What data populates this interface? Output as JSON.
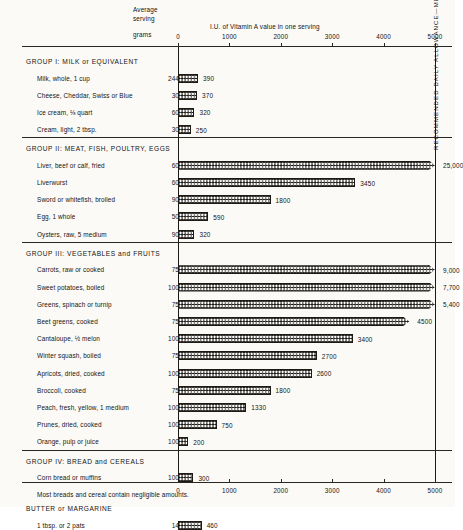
{
  "header": {
    "average_serving_line1": "Average",
    "average_serving_line2": "serving",
    "grams_label": "grams",
    "chart_subtitle": "I.U. of Vitamin A value in one serving"
  },
  "rda_label": "RECOMMENDED DAILY ALLOWANCE—MEN AND WOMEN",
  "axis": {
    "ticks": [
      "0",
      "1000",
      "2000",
      "3000",
      "4000",
      "5000"
    ],
    "tick_values": [
      0,
      1000,
      2000,
      3000,
      4000,
      5000
    ]
  },
  "groups": [
    {
      "title": "GROUP I: MILK or EQUIVALENT",
      "rows": [
        {
          "food": "Milk, whole, 1 cup",
          "grams": "244",
          "value": 390,
          "value_label": "390"
        },
        {
          "food": "Cheese, Cheddar, Swiss or Blue",
          "grams": "30",
          "value": 370,
          "value_label": "370"
        },
        {
          "food": "Ice cream, ⅛ quart",
          "grams": "60",
          "value": 320,
          "value_label": "320"
        },
        {
          "food": "Cream, light, 2 tbsp.",
          "grams": "30",
          "value": 250,
          "value_label": "250"
        }
      ]
    },
    {
      "title": "GROUP II: MEAT, FISH, POULTRY, EGGS",
      "rows": [
        {
          "food": "Liver, beef or calf, fried",
          "grams": "60",
          "value": 25000,
          "value_label": "25,000",
          "clipped": true
        },
        {
          "food": "Liverwurst",
          "grams": "60",
          "value": 3450,
          "value_label": "3450"
        },
        {
          "food": "Sword or whitefish, broiled",
          "grams": "90",
          "value": 1800,
          "value_label": "1800"
        },
        {
          "food": "Egg, 1 whole",
          "grams": "50",
          "value": 590,
          "value_label": "590"
        },
        {
          "food": "Oysters, raw, 5 medium",
          "grams": "90",
          "value": 320,
          "value_label": "320"
        }
      ]
    },
    {
      "title": "GROUP III: VEGETABLES and FRUITS",
      "rows": [
        {
          "food": "Carrots, raw or cooked",
          "grams": "75",
          "value": 9000,
          "value_label": "9,000",
          "clipped": true
        },
        {
          "food": "Sweet potatoes, boiled",
          "grams": "100",
          "value": 7700,
          "value_label": "7,700",
          "clipped": true
        },
        {
          "food": "Greens, spinach or turnip",
          "grams": "75",
          "value": 5400,
          "value_label": "5,400",
          "clipped": true
        },
        {
          "food": "Beet greens, cooked",
          "grams": "75",
          "value": 4500,
          "value_label": "4500",
          "clipped": true
        },
        {
          "food": "Cantaloupe, ½ melon",
          "grams": "100",
          "value": 3400,
          "value_label": "3400"
        },
        {
          "food": "Winter squash, boiled",
          "grams": "75",
          "value": 2700,
          "value_label": "2700"
        },
        {
          "food": "Apricots, dried, cooked",
          "grams": "100",
          "value": 2600,
          "value_label": "2600"
        },
        {
          "food": "Broccoli, cooked",
          "grams": "75",
          "value": 1800,
          "value_label": "1800"
        },
        {
          "food": "Peach, fresh, yellow, 1 medium",
          "grams": "100",
          "value": 1330,
          "value_label": "1330"
        },
        {
          "food": "Prunes, dried, cooked",
          "grams": "100",
          "value": 750,
          "value_label": "750"
        },
        {
          "food": "Orange, pulp or juice",
          "grams": "100",
          "value": 200,
          "value_label": "200"
        }
      ]
    },
    {
      "title": "GROUP IV: BREAD and CEREALS",
      "rows": [
        {
          "food": "Corn bread or muffins",
          "grams": "100",
          "value": 300,
          "value_label": "300"
        }
      ],
      "note": "Most breads and cereal contain negligible amounts."
    },
    {
      "title": "BUTTER or MARGARINE",
      "is_sub": true,
      "rows": [
        {
          "food": "1 tbsp. or 2 pats",
          "grams": "14",
          "value": 460,
          "value_label": "460"
        }
      ]
    }
  ],
  "chart_data": {
    "type": "bar",
    "orientation": "horizontal",
    "title": "",
    "subtitle": "I.U. of Vitamin A value in one serving",
    "xlabel": "I.U. of Vitamin A value in one serving",
    "ylabel": "",
    "xlim": [
      0,
      5000
    ],
    "xticks": [
      0,
      1000,
      2000,
      3000,
      4000,
      5000
    ],
    "grid": false,
    "legend": null,
    "annotations": [
      {
        "text": "RECOMMENDED DAILY ALLOWANCE—MEN AND WOMEN",
        "x": 5000,
        "orientation": "vertical"
      },
      {
        "text": "Most breads and cereal contain negligible amounts.",
        "group": "GROUP IV: BREAD and CEREALS"
      }
    ],
    "categories": [
      "Milk, whole, 1 cup",
      "Cheese, Cheddar, Swiss or Blue",
      "Ice cream, ⅛ quart",
      "Cream, light, 2 tbsp.",
      "Liver, beef or calf, fried",
      "Liverwurst",
      "Sword or whitefish, broiled",
      "Egg, 1 whole",
      "Oysters, raw, 5 medium",
      "Carrots, raw or cooked",
      "Sweet potatoes, boiled",
      "Greens, spinach or turnip",
      "Beet greens, cooked",
      "Cantaloupe, ½ melon",
      "Winter squash, boiled",
      "Apricots, dried, cooked",
      "Broccoli, cooked",
      "Peach, fresh, yellow, 1 medium",
      "Prunes, dried, cooked",
      "Orange, pulp or juice",
      "Corn bread or muffins",
      "1 tbsp. or 2 pats"
    ],
    "values": [
      390,
      370,
      320,
      250,
      25000,
      3450,
      1800,
      590,
      320,
      9000,
      7700,
      5400,
      4500,
      3400,
      2700,
      2600,
      1800,
      1330,
      750,
      200,
      300,
      460
    ],
    "serving_grams": [
      244,
      30,
      60,
      30,
      60,
      60,
      90,
      50,
      90,
      75,
      100,
      75,
      75,
      100,
      75,
      100,
      75,
      100,
      100,
      100,
      100,
      14
    ],
    "units": "I.U."
  }
}
